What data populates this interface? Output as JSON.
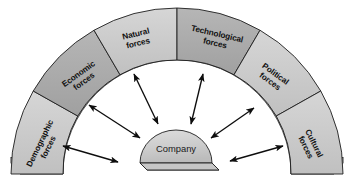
{
  "diagram": {
    "center": {
      "label": "Company",
      "shape": "dome"
    },
    "arch": {
      "shape": "semicircular-arch",
      "segment_count": 6,
      "segments": [
        {
          "id": "demographic",
          "label_line1": "Demographic",
          "label_line2": "forces",
          "tone": "light",
          "color": "#c9c9c9"
        },
        {
          "id": "economic",
          "label_line1": "Economic",
          "label_line2": "forces",
          "tone": "dark",
          "color": "#ababab"
        },
        {
          "id": "natural",
          "label_line1": "Natural",
          "label_line2": "forces",
          "tone": "light",
          "color": "#c9c9c9"
        },
        {
          "id": "technological",
          "label_line1": "Technological",
          "label_line2": "forces",
          "tone": "dark",
          "color": "#ababab"
        },
        {
          "id": "political",
          "label_line1": "Political",
          "label_line2": "forces",
          "tone": "light",
          "color": "#c9c9c9"
        },
        {
          "id": "cultural",
          "label_line1": "Cultural",
          "label_line2": "forces",
          "tone": "light",
          "color": "#c9c9c9"
        }
      ]
    },
    "arrows": {
      "count": 6,
      "style": "double-headed",
      "description": "Double-headed arrows radiating between the Company dome and the surrounding arch of forces"
    },
    "colors": {
      "background": "#ffffff",
      "segment_light": "#c9c9c9",
      "segment_dark": "#ababab",
      "inner_shadow_band": "#9a9a9a",
      "extrusion_side": "#b4b4b4",
      "extrusion_bottom": "#d4d4d4",
      "dome_fill": "#cfcfcf",
      "dome_base": "#c2c2c2",
      "outline": "#1e1e1e",
      "arrow": "#0d0d0d",
      "text": "#111111"
    }
  }
}
